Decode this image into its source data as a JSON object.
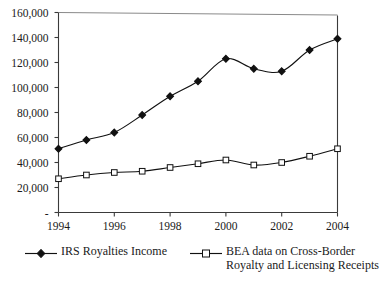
{
  "chart_data": {
    "type": "line",
    "title": "",
    "xlabel": "",
    "ylabel": "",
    "x": [
      1994,
      1995,
      1996,
      1997,
      1998,
      1999,
      2000,
      2001,
      2002,
      2003,
      2004
    ],
    "xlim": [
      1994,
      2004
    ],
    "ylim": [
      0,
      160000
    ],
    "grid": false,
    "legend_position": "bottom",
    "x_tick_labels": [
      "1994",
      "1996",
      "1998",
      "2000",
      "2002",
      "2004"
    ],
    "x_tick_values": [
      1994,
      1996,
      1998,
      2000,
      2002,
      2004
    ],
    "y_tick_labels": [
      "-",
      "20,000",
      "40,000",
      "60,000",
      "80,000",
      "100,000",
      "120,000",
      "140,000",
      "160,000"
    ],
    "y_tick_values": [
      0,
      20000,
      40000,
      60000,
      80000,
      100000,
      120000,
      140000,
      160000
    ],
    "series": [
      {
        "name": "IRS Royalties Income",
        "marker": "filled-diamond",
        "values": [
          51000,
          58000,
          64000,
          78000,
          93000,
          105000,
          123000,
          115000,
          113000,
          130000,
          139000
        ]
      },
      {
        "name": "BEA data on Cross-Border Royalty and Licensing Receipts",
        "marker": "open-square",
        "values": [
          27000,
          30000,
          32000,
          33000,
          36000,
          39000,
          42000,
          38000,
          40000,
          45000,
          51000
        ]
      }
    ]
  },
  "legend": {
    "items": [
      {
        "label": "IRS Royalties Income",
        "label_line2": ""
      },
      {
        "label": "BEA data on Cross-Border",
        "label_line2": "Royalty and Licensing Receipts"
      }
    ]
  },
  "colors": {
    "series1": "#111111",
    "series2": "#111111",
    "axis": "#3a3a3a",
    "background": "#ffffff"
  }
}
